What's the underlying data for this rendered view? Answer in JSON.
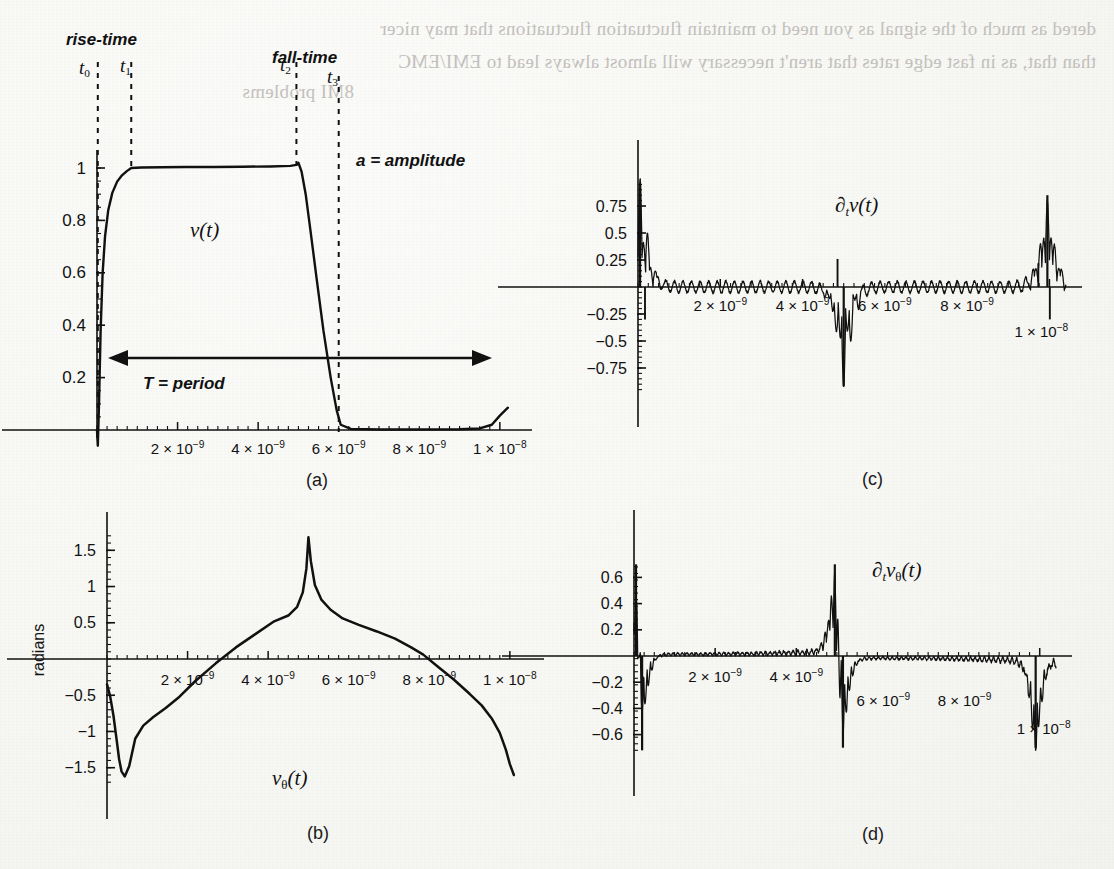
{
  "page": {
    "background_color": "#f7f7f4",
    "ink_color": "#111111",
    "bleed_color": "#b9b6b2",
    "bleed_text_line1": "dered as much of the signal as you need to maintain fluctuation fluctuations that may nicer",
    "bleed_text_line2": "than that, as in fast edge rates that aren't necessary will almost always lead to EMI/EMC",
    "bleed_text_line3": "8MI problems"
  },
  "figure": {
    "x_tick_labels": [
      "2 × 10",
      "4 × 10",
      "6 × 10",
      "8 × 10",
      "1 × 10"
    ],
    "x_tick_exponents": [
      "−9",
      "−9",
      "−9",
      "−9",
      "−8"
    ],
    "x_tick_values": [
      2e-09,
      4e-09,
      6e-09,
      8e-09,
      1e-08
    ]
  },
  "panels": [
    {
      "id": "a",
      "caption": "(a)",
      "series_label": "v(t)",
      "annotations": [
        {
          "name": "rise-time-label",
          "text": "rise-time"
        },
        {
          "name": "fall-time-label",
          "text": "fall-time"
        },
        {
          "name": "amplitude-label",
          "text": "a = amplitude"
        },
        {
          "name": "period-label",
          "text": "T = period"
        }
      ],
      "time_markers": [
        {
          "name": "t0",
          "base": "t",
          "sub": "0"
        },
        {
          "name": "t1",
          "base": "t",
          "sub": "1"
        },
        {
          "name": "t2",
          "base": "t",
          "sub": "2"
        },
        {
          "name": "t3",
          "base": "t",
          "sub": "3"
        }
      ],
      "y_tick_labels": [
        "0.2",
        "0.4",
        "0.6",
        "0.8",
        "1"
      ],
      "y_tick_values": [
        0.2,
        0.4,
        0.6,
        0.8,
        1.0
      ]
    },
    {
      "id": "b",
      "caption": "(b)",
      "series_label": "vθ(t)",
      "y_axis_title": "radians",
      "y_tick_labels": [
        "1.5",
        "1",
        "0.5",
        "−0.5",
        "−1",
        "−1.5"
      ],
      "y_tick_values": [
        1.5,
        1.0,
        0.5,
        -0.5,
        -1.0,
        -1.5
      ]
    },
    {
      "id": "c",
      "caption": "(c)",
      "series_label": "∂tv(t)",
      "y_tick_labels": [
        "0.75",
        "0.5",
        "0.25",
        "−0.25",
        "−0.5",
        "−0.75"
      ],
      "y_tick_values": [
        0.75,
        0.5,
        0.25,
        -0.25,
        -0.5,
        -0.75
      ]
    },
    {
      "id": "d",
      "caption": "(d)",
      "series_label": "∂tvθ(t)",
      "y_tick_labels": [
        "0.6",
        "0.4",
        "0.2",
        "−0.2",
        "−0.4",
        "−0.6"
      ],
      "y_tick_values": [
        0.6,
        0.4,
        0.2,
        -0.2,
        -0.4,
        -0.6
      ]
    }
  ],
  "chart_data": [
    {
      "type": "line",
      "panel": "a",
      "title": "v(t)",
      "xlabel": "",
      "ylabel": "",
      "xlim": [
        0,
        1.05e-08
      ],
      "ylim": [
        -0.06,
        1.1
      ],
      "grid": false,
      "legend": "none",
      "annotations": [
        "rise-time",
        "fall-time",
        "a = amplitude",
        "T = period",
        "t0",
        "t1",
        "t2",
        "t3"
      ],
      "markers": {
        "t0": 2e-11,
        "t1": 8.5e-10,
        "t2": 4.95e-09,
        "t3": 6e-09
      },
      "description": "Trapezoidal digital pulse: sharp undershoot at t0, exponential rise to amplitude 1 by t1, flat top through t2, steep fall to 0 at t3, small upturn at the end of the period.",
      "x": [
        0.0,
        2e-11,
        5e-11,
        9e-11,
        1.4e-10,
        2e-10,
        2.8e-10,
        3.8e-10,
        5e-10,
        6.2e-10,
        7.4e-10,
        8.5e-10,
        1.1e-09,
        1.6e-09,
        2.2e-09,
        2.9e-09,
        3.6e-09,
        4.3e-09,
        4.8e-09,
        4.95e-09,
        5e-09,
        5.08e-09,
        5.18e-09,
        5.3e-09,
        5.45e-09,
        5.62e-09,
        5.8e-09,
        5.95e-09,
        6.05e-09,
        6.3e-09,
        7e-09,
        8e-09,
        9e-09,
        9.5e-09,
        9.8e-09,
        1e-08,
        1.02e-08
      ],
      "y": [
        0.0,
        -0.06,
        0.1,
        0.38,
        0.6,
        0.74,
        0.84,
        0.905,
        0.948,
        0.972,
        0.988,
        1.0,
        1.002,
        1.003,
        1.004,
        1.004,
        1.005,
        1.006,
        1.008,
        1.012,
        1.02,
        0.985,
        0.9,
        0.76,
        0.58,
        0.38,
        0.2,
        0.075,
        0.02,
        0.004,
        0.002,
        0.002,
        0.003,
        0.006,
        0.02,
        0.055,
        0.085
      ]
    },
    {
      "type": "line",
      "panel": "b",
      "title": "vθ(t)",
      "xlabel": "",
      "ylabel": "radians",
      "xlim": [
        0,
        1.05e-08
      ],
      "ylim": [
        -1.75,
        1.8
      ],
      "grid": false,
      "legend": "none",
      "description": "Phase of the pulse in radians: starts near -0.35, dips to a sharp minimum of about -1.62 just after t=0, rises monotonically crossing zero near 2.2e-9, peaks sharply at about 1.68 at t=5e-9, then descends monotonically crossing zero near 7.8e-9 and falling steeply to about -1.6 at the right edge.",
      "x": [
        0.0,
        8e-11,
        1.6e-10,
        2.4e-10,
        3e-10,
        3.6e-10,
        4.4e-10,
        5.5e-10,
        7e-10,
        9e-10,
        1.15e-09,
        1.45e-09,
        1.8e-09,
        2.2e-09,
        2.7e-09,
        3.2e-09,
        3.7e-09,
        4.15e-09,
        4.5e-09,
        4.72e-09,
        4.86e-09,
        4.95e-09,
        5e-09,
        5.06e-09,
        5.16e-09,
        5.32e-09,
        5.55e-09,
        5.85e-09,
        6.25e-09,
        6.7e-09,
        7.15e-09,
        7.55e-09,
        7.85e-09,
        8.2e-09,
        8.6e-09,
        9e-09,
        9.3e-09,
        9.55e-09,
        9.75e-09,
        9.9e-09,
        1e-08,
        1.01e-08
      ],
      "y": [
        -0.35,
        -0.52,
        -0.78,
        -1.12,
        -1.38,
        -1.55,
        -1.62,
        -1.48,
        -1.1,
        -0.92,
        -0.8,
        -0.68,
        -0.52,
        -0.3,
        -0.06,
        0.16,
        0.35,
        0.52,
        0.6,
        0.72,
        0.92,
        1.25,
        1.68,
        1.35,
        1.02,
        0.82,
        0.68,
        0.56,
        0.47,
        0.38,
        0.28,
        0.16,
        0.06,
        -0.1,
        -0.28,
        -0.48,
        -0.64,
        -0.82,
        -1.02,
        -1.25,
        -1.45,
        -1.6
      ]
    },
    {
      "type": "line",
      "panel": "c",
      "title": "∂tv(t)",
      "xlabel": "",
      "ylabel": "",
      "xlim": [
        0,
        1.05e-08
      ],
      "ylim": [
        -1.0,
        1.0
      ],
      "grid": false,
      "legend": "none",
      "description": "Time derivative of v(t): dense Gibbs ringing about zero with a large positive burst up to ~0.95 at t=0 (the rising edge), a large negative burst down to ~-0.92 at t=5e-9 (the falling edge), and a tall positive spike near t=1e-8 where the next period begins.",
      "ringing_envelope": 0.055,
      "bursts": [
        {
          "t": 5e-11,
          "peak": 0.95,
          "sign": "positive"
        },
        {
          "t": 5e-09,
          "peak": -0.92,
          "sign": "negative"
        },
        {
          "t": 9.95e-09,
          "peak": 0.85,
          "sign": "positive"
        }
      ]
    },
    {
      "type": "line",
      "panel": "d",
      "title": "∂tvθ(t)",
      "xlabel": "",
      "ylabel": "",
      "xlim": [
        0,
        1.05e-08
      ],
      "ylim": [
        -0.78,
        0.78
      ],
      "grid": false,
      "legend": "none",
      "description": "Time derivative of the phase: a positive spike to ~0.70 and negative spike to ~-0.72 at t=0, low-amplitude positive ripple from 0 to 5e-9 growing toward a +0.70 spike at 5e-9 followed by a -0.70 spike, then low-amplitude negative ripple from 5e-9 to 1e-8 ending in a -0.70 spike at the right edge.",
      "ringing_envelope": 0.045,
      "bursts": [
        {
          "t": 5e-11,
          "peak": 0.7,
          "sign": "positive"
        },
        {
          "t": 2e-10,
          "peak": -0.72,
          "sign": "negative"
        },
        {
          "t": 4.95e-09,
          "peak": 0.7,
          "sign": "positive"
        },
        {
          "t": 5.15e-09,
          "peak": -0.7,
          "sign": "negative"
        },
        {
          "t": 9.9e-09,
          "peak": -0.7,
          "sign": "negative"
        }
      ]
    }
  ]
}
